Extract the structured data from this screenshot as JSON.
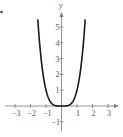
{
  "chart_data": {
    "type": "line",
    "title": "",
    "function": "y = x^4",
    "xlabel": "",
    "ylabel": "y",
    "xlim": [
      -3.3,
      3.6
    ],
    "ylim": [
      -1.4,
      6
    ],
    "x_ticks": [
      -3,
      -2,
      -1,
      1,
      2,
      3
    ],
    "y_ticks": [
      -1,
      1,
      2,
      3,
      4,
      5
    ],
    "grid": false,
    "legend": null,
    "series": [
      {
        "name": "y = x^4",
        "x": [
          -1.53,
          -1.4,
          -1.2,
          -1.0,
          -0.8,
          -0.6,
          -0.4,
          -0.2,
          0,
          0.2,
          0.4,
          0.6,
          0.8,
          1.0,
          1.2,
          1.4,
          1.53
        ],
        "y": [
          5.48,
          3.84,
          2.07,
          1.0,
          0.41,
          0.13,
          0.03,
          0.0,
          0,
          0.0,
          0.03,
          0.13,
          0.41,
          1.0,
          2.07,
          3.84,
          5.48
        ]
      }
    ]
  },
  "colors": {
    "curve": "#1a1a1a",
    "axis": "#777777",
    "text": "#555555",
    "background": "#ffffff"
  }
}
